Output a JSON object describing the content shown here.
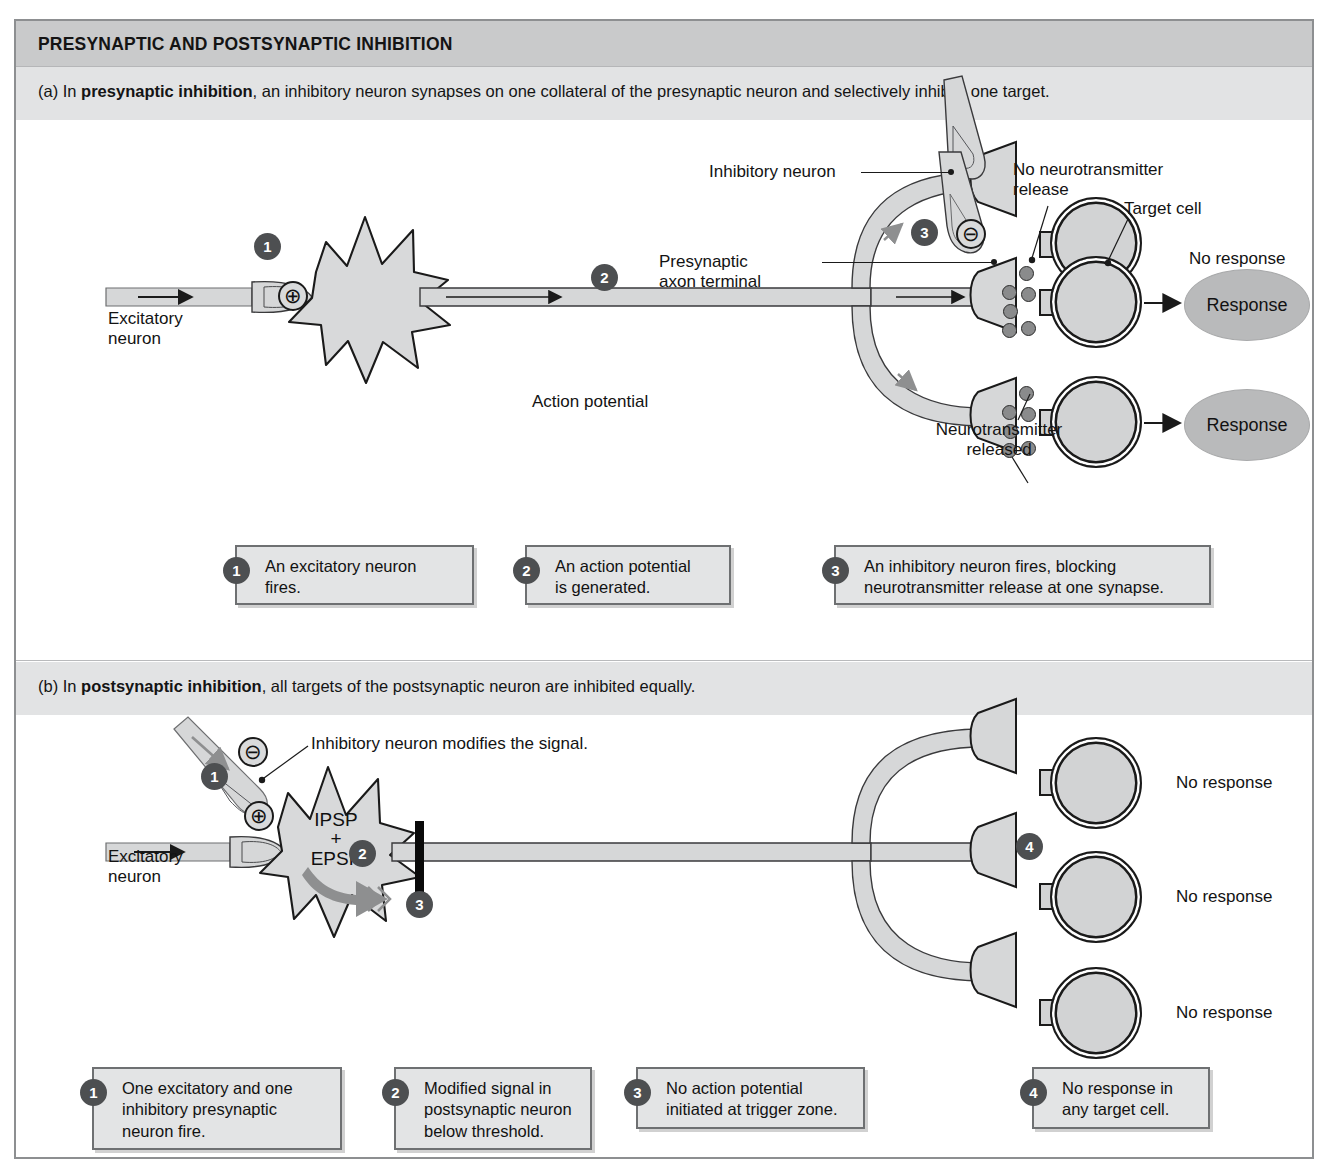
{
  "figure": {
    "title": "PRESYNAPTIC AND POSTSYNAPTIC INHIBITION",
    "panel_a": {
      "caption_prefix": "(a) In ",
      "caption_bold": "presynaptic inhibition",
      "caption_rest": ", an inhibitory neuron synapses on one collateral of the presynaptic neuron and selectively inhibits one target.",
      "labels": {
        "excitatory_neuron": "Excitatory\nneuron",
        "inhibitory_neuron": "Inhibitory neuron",
        "presynaptic_axon_terminal": "Presynaptic\naxon terminal",
        "no_neurotransmitter_release": "No neurotransmitter\nrelease",
        "target_cell": "Target cell",
        "no_response": "No response",
        "action_potential": "Action potential",
        "neurotransmitter_released": "Neurotransmitter\nreleased",
        "response_1": "Response",
        "response_2": "Response",
        "plus_sign": "⊕",
        "minus_sign": "⊖"
      },
      "steps": [
        {
          "num": "1",
          "text": "An excitatory neuron\nfires."
        },
        {
          "num": "2",
          "text": "An action potential\nis generated."
        },
        {
          "num": "3",
          "text": "An inhibitory neuron fires, blocking\nneurotransmitter release at one synapse."
        }
      ],
      "inline_step_markers": [
        "1",
        "2",
        "3"
      ]
    },
    "panel_b": {
      "caption_prefix": "(b) In ",
      "caption_bold": "postsynaptic inhibition",
      "caption_rest": ", all targets of the postsynaptic neuron are inhibited equally.",
      "labels": {
        "excitatory_neuron": "Excitatory\nneuron",
        "inhibitory_modifies": "Inhibitory neuron modifies the signal.",
        "ipsp_epsp": "IPSP\n+\nEPSP",
        "no_response_1": "No response",
        "no_response_2": "No response",
        "no_response_3": "No response",
        "plus_sign": "⊕",
        "minus_sign": "⊖"
      },
      "steps": [
        {
          "num": "1",
          "text": "One excitatory and one\ninhibitory presynaptic\nneuron fire."
        },
        {
          "num": "2",
          "text": "Modified signal in\npostsynaptic neuron\nbelow threshold."
        },
        {
          "num": "3",
          "text": "No action potential\ninitiated at trigger zone."
        },
        {
          "num": "4",
          "text": "No response in\nany target cell."
        }
      ],
      "inline_step_markers": [
        "1",
        "2",
        "3",
        "4"
      ]
    },
    "colors": {
      "title_band": "#c9cacb",
      "caption_band": "#e2e3e4",
      "frame_border": "#8d8f91",
      "cell_fill": "#d2d3d4",
      "neuron_fill": "#d8d9da",
      "response_fill": "#b9babb",
      "step_bullet": "#4d4f51",
      "caption_box_fill": "#e3e4e5",
      "ink": "#1a1a1a"
    }
  }
}
